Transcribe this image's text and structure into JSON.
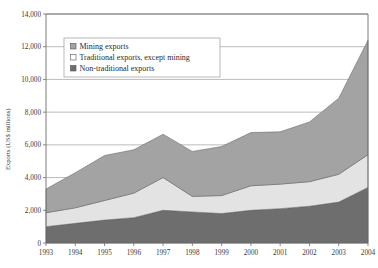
{
  "chart_data": {
    "type": "area",
    "stacked": true,
    "title": "",
    "subtitle": "",
    "xlabel": "",
    "ylabel": "Exports (US$ millions)",
    "categories": [
      "1993",
      "1994",
      "1995",
      "1996",
      "1997",
      "1998",
      "1999",
      "2000",
      "2001",
      "2002",
      "2003",
      "2004"
    ],
    "x": [
      1993,
      1994,
      1995,
      1996,
      1997,
      1998,
      1999,
      2000,
      2001,
      2002,
      2003,
      2004
    ],
    "xlim": [
      1993,
      2004
    ],
    "ylim": [
      0,
      14000
    ],
    "ytick_step": 2000,
    "ytick_labels": [
      "0",
      "2,000",
      "4,000",
      "6,000",
      "8,000",
      "10,000",
      "12,000",
      "14,000"
    ],
    "ytick_values": [
      0,
      2000,
      4000,
      6000,
      8000,
      10000,
      12000,
      14000
    ],
    "grid": true,
    "grid_axis": "y",
    "legend_position": "top-left-inside",
    "series": [
      {
        "name": "Non-traditional exports",
        "color": "#6e6e6e",
        "stack_order": 1,
        "values": [
          1000,
          1200,
          1400,
          1550,
          2000,
          1900,
          1800,
          2000,
          2100,
          2250,
          2500,
          3400
        ]
      },
      {
        "name": "Traditional exports, except mining",
        "color": "#e3e3e3",
        "stack_order": 2,
        "values": [
          850,
          950,
          1200,
          1500,
          2000,
          950,
          1100,
          1500,
          1500,
          1500,
          1700,
          2000
        ]
      },
      {
        "name": "Mining exports",
        "color": "#a3a3a3",
        "stack_order": 3,
        "values": [
          1450,
          2150,
          2750,
          2650,
          2650,
          2750,
          3000,
          3250,
          3200,
          3650,
          4650,
          7000
        ]
      }
    ],
    "cumulative": {
      "non_traditional": [
        1000,
        1200,
        1400,
        1550,
        2000,
        1900,
        1800,
        2000,
        2100,
        2250,
        2500,
        3400
      ],
      "through_traditional": [
        1850,
        2150,
        2600,
        3050,
        4000,
        2850,
        2900,
        3500,
        3600,
        3750,
        4200,
        5400
      ],
      "total": [
        3300,
        4300,
        5350,
        5700,
        6650,
        5600,
        5900,
        6750,
        6800,
        7400,
        8850,
        12400
      ]
    }
  },
  "legend": {
    "items": [
      {
        "label": "Mining exports",
        "swatch": "#a3a3a3"
      },
      {
        "label": "Traditional exports, except mining",
        "swatch": "#ffffff"
      },
      {
        "label": "Non-traditional exports",
        "swatch": "#6e6e6e"
      }
    ]
  },
  "axes": {
    "y_title": "Exports (US$ millions)"
  },
  "colors": {
    "mining": "#a3a3a3",
    "traditional": "#e3e3e3",
    "non_traditional": "#6e6e6e",
    "grid": "#8f8f8f",
    "axis": "#6d6d6d",
    "background": "#ffffff"
  }
}
